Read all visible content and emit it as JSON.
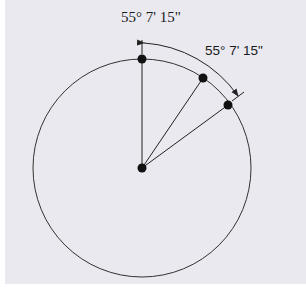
{
  "diagram": {
    "title_label": "55° 7' 15\"",
    "arc_label": "55° 7' 15\"",
    "colors": {
      "background": "#e9e9ef",
      "stroke": "#222222",
      "point": "#111111"
    },
    "circle": {
      "cx": 142,
      "cy": 168,
      "r": 109
    },
    "points": [
      {
        "name": "center",
        "x": 142,
        "y": 168
      },
      {
        "name": "top",
        "x": 142,
        "y": 59
      },
      {
        "name": "middle",
        "x": 203,
        "y": 78
      },
      {
        "name": "right",
        "x": 228,
        "y": 105
      }
    ]
  }
}
